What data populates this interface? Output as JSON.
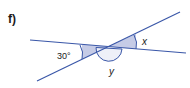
{
  "problem": {
    "label": "f)"
  },
  "diagram": {
    "type": "intersecting-lines",
    "line_color": "#3a57a8",
    "shade_color": "#c5cbe6",
    "angles": {
      "given": "30°",
      "x": "x",
      "y": "y"
    }
  }
}
